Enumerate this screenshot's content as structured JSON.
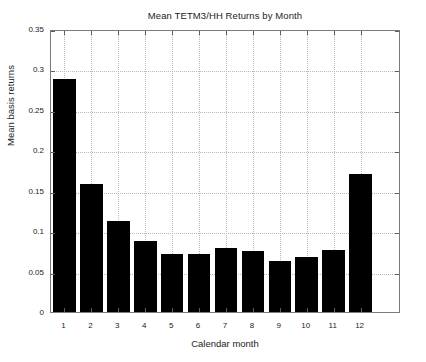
{
  "chart_data": {
    "type": "bar",
    "title": "Mean TETM3/HH Returns by Month",
    "xlabel": "Calendar month",
    "ylabel": "Mean basis returns",
    "categories": [
      "1",
      "2",
      "3",
      "4",
      "5",
      "6",
      "7",
      "8",
      "9",
      "10",
      "11",
      "12"
    ],
    "values": [
      0.288,
      0.158,
      0.112,
      0.088,
      0.072,
      0.072,
      0.079,
      0.075,
      0.063,
      0.068,
      0.077,
      0.171
    ],
    "series": [
      {
        "name": "Mean basis returns",
        "values": [
          0.288,
          0.158,
          0.112,
          0.088,
          0.072,
          0.072,
          0.079,
          0.075,
          0.063,
          0.068,
          0.077,
          0.171
        ]
      }
    ],
    "ylim": [
      0,
      0.35
    ],
    "ytick_values": [
      0,
      0.05,
      0.1,
      0.15,
      0.2,
      0.25,
      0.3,
      0.35
    ],
    "ytick_labels": [
      "0",
      "0.05",
      "0.1",
      "0.15",
      "0.2",
      "0.25",
      "0.3",
      "0.35"
    ],
    "xtick_labels": [
      "1",
      "2",
      "3",
      "4",
      "5",
      "6",
      "7",
      "8",
      "9",
      "10",
      "11",
      "12"
    ],
    "xlim": [
      0.5,
      13.5
    ],
    "grid": true,
    "grid_style": "dotted",
    "legend": null,
    "bar_color": "#000000",
    "grid_color": "#b9b9b9",
    "axis_color": "#7a7a7a",
    "background_color": "#ffffff"
  }
}
